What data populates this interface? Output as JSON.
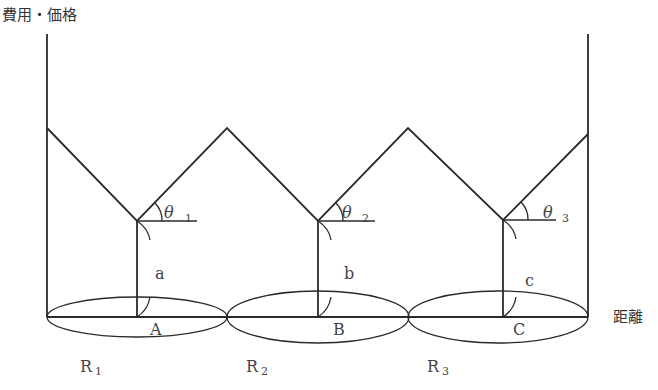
{
  "axes": {
    "y_label": "費用・価格",
    "x_label": "距離"
  },
  "markets": [
    {
      "center_label": "A",
      "height_label": "a",
      "angle_label": "θ",
      "angle_sub": "1",
      "region_label": "R",
      "region_sub": "1"
    },
    {
      "center_label": "B",
      "height_label": "b",
      "angle_label": "θ",
      "angle_sub": "2",
      "region_label": "R",
      "region_sub": "2"
    },
    {
      "center_label": "C",
      "height_label": "c",
      "angle_label": "θ",
      "angle_sub": "3",
      "region_label": "R",
      "region_sub": "3"
    }
  ],
  "colors": {
    "line": "#2a2a2a",
    "text": "#444444",
    "background": "#ffffff"
  }
}
